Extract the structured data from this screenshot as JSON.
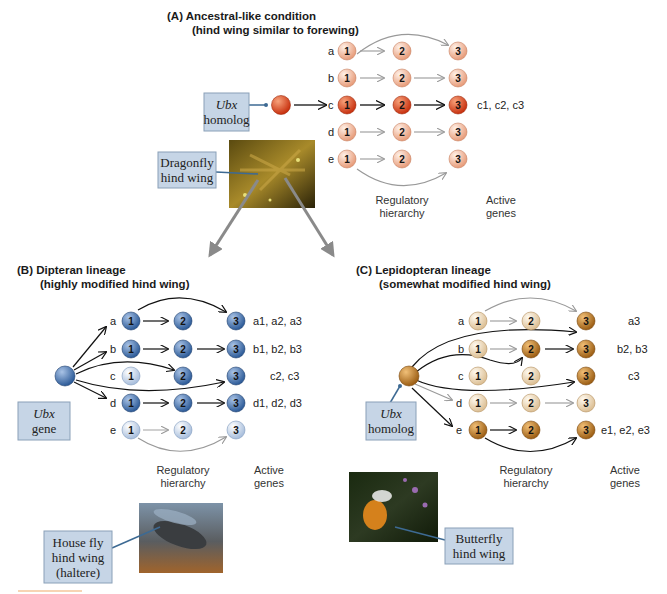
{
  "panelA": {
    "title_line1": "(A)   Ancestral-like condition",
    "title_line2": "(hind wing similar to forewing)",
    "rows": [
      "a",
      "b",
      "c",
      "d",
      "e"
    ],
    "node_numbers": [
      "1",
      "2",
      "3"
    ],
    "active_genes": "c1, c2, c3",
    "box_line1": "Ubx",
    "box_line2": "homolog",
    "photo_label_line1": "Dragonfly",
    "photo_label_line2": "hind wing",
    "caption_reg_1": "Regulatory",
    "caption_reg_2": "hierarchy",
    "caption_active_1": "Active",
    "caption_active_2": "genes",
    "colors": {
      "light": "#f2c2a8",
      "dark": "#d9431c"
    }
  },
  "panelB": {
    "title_line1": "(B)   Dipteran lineage",
    "title_line2": "(highly modified hind wing)",
    "rows": [
      "a",
      "b",
      "c",
      "d",
      "e"
    ],
    "active_genes": [
      "a1, a2, a3",
      "b1, b2, b3",
      "c2, c3",
      "d1, d2, d3",
      ""
    ],
    "box_line1": "Ubx",
    "box_line2": "gene",
    "photo_label_line1": "House fly",
    "photo_label_line2": "hind wing",
    "photo_label_line3": "(haltere)",
    "caption_reg_1": "Regulatory",
    "caption_reg_2": "hierarchy",
    "caption_active_1": "Active",
    "caption_active_2": "genes",
    "colors": {
      "light": "#c9d7ea",
      "dark": "#3f6fae"
    }
  },
  "panelC": {
    "title_line1": "(C)   Lepidopteran lineage",
    "title_line2": "(somewhat modified hind wing)",
    "rows": [
      "a",
      "b",
      "c",
      "d",
      "e"
    ],
    "active_genes": [
      "a3",
      "b2, b3",
      "c3",
      "",
      "e1, e2, e3"
    ],
    "box_line1": "Ubx",
    "box_line2": "homolog",
    "photo_label_line1": "Butterfly",
    "photo_label_line2": "hind wing",
    "caption_reg_1": "Regulatory",
    "caption_reg_2": "hierarchy",
    "caption_active_1": "Active",
    "caption_active_2": "genes",
    "colors": {
      "light": "#efdcc0",
      "dark": "#b7741e"
    }
  }
}
